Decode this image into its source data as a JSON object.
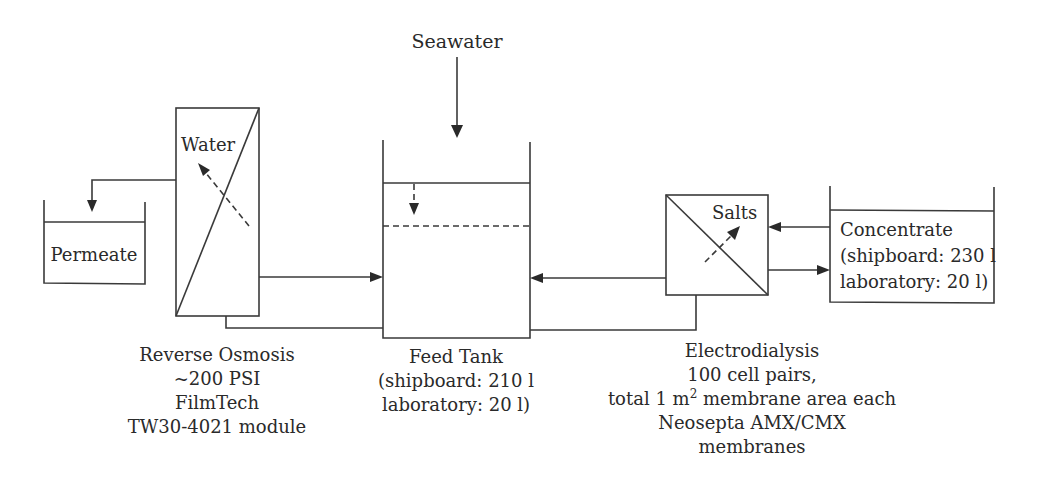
{
  "diagram": {
    "type": "process-flow",
    "colors": {
      "line": "#3a3a3a",
      "text": "#2a2a2a",
      "background": "#ffffff"
    },
    "inputs": {
      "seawater": "Seawater"
    },
    "feed_tank": {
      "title": "Feed Tank",
      "line2": "(shipboard: 210 l",
      "line3": "laboratory: 20 l)"
    },
    "reverse_osmosis": {
      "flow_label": "Water",
      "line1": "Reverse Osmosis",
      "line2": "~200 PSI",
      "line3": "FilmTech",
      "line4": "TW30-4021 module"
    },
    "permeate": {
      "label": "Permeate"
    },
    "electrodialysis": {
      "flow_label": "Salts",
      "line1": "Electrodialysis",
      "line2": "100 cell pairs,",
      "line3_pre": "total 1 m",
      "line3_sup": "2",
      "line3_post": " membrane area each",
      "line4": "Neosepta AMX/CMX",
      "line5": "membranes"
    },
    "concentrate": {
      "line1": "Concentrate",
      "line2": "(shipboard: 230 l",
      "line3": "laboratory: 20 l)"
    }
  }
}
